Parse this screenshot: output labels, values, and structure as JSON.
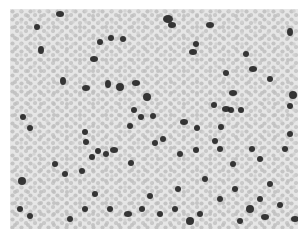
{
  "image": {
    "subject": "microscopy blood smear",
    "background_color": "#e4e4e4",
    "rbc_color": "#c2c2c2",
    "stained_cell_color": "#222222"
  },
  "stained_cells": [
    [
      50,
      5,
      4,
      3
    ],
    [
      101,
      29,
      3,
      3
    ],
    [
      84,
      50,
      4,
      3
    ],
    [
      90,
      33,
      3,
      3
    ],
    [
      113,
      30,
      3,
      3
    ],
    [
      31,
      41,
      3,
      4
    ],
    [
      27,
      18,
      3,
      3
    ],
    [
      53,
      72,
      3,
      4
    ],
    [
      76,
      79,
      4,
      3
    ],
    [
      98,
      75,
      3,
      4
    ],
    [
      110,
      78,
      4,
      4
    ],
    [
      126,
      74,
      4,
      3
    ],
    [
      137,
      88,
      4,
      4
    ],
    [
      158,
      10,
      5,
      4
    ],
    [
      162,
      16,
      4,
      3
    ],
    [
      200,
      16,
      4,
      3
    ],
    [
      186,
      35,
      3,
      3
    ],
    [
      183,
      43,
      4,
      3
    ],
    [
      236,
      45,
      3,
      3
    ],
    [
      243,
      60,
      4,
      3
    ],
    [
      280,
      23,
      3,
      4
    ],
    [
      216,
      64,
      3,
      3
    ],
    [
      223,
      84,
      4,
      3
    ],
    [
      260,
      70,
      3,
      3
    ],
    [
      216,
      100,
      4,
      3
    ],
    [
      204,
      96,
      3,
      3
    ],
    [
      231,
      101,
      3,
      3
    ],
    [
      283,
      86,
      4,
      4
    ],
    [
      280,
      97,
      3,
      3
    ],
    [
      13,
      108,
      3,
      3
    ],
    [
      20,
      119,
      3,
      3
    ],
    [
      75,
      123,
      3,
      3
    ],
    [
      76,
      133,
      3,
      3
    ],
    [
      120,
      117,
      3,
      3
    ],
    [
      131,
      108,
      3,
      3
    ],
    [
      124,
      101,
      3,
      3
    ],
    [
      174,
      113,
      4,
      3
    ],
    [
      187,
      119,
      3,
      3
    ],
    [
      211,
      118,
      3,
      3
    ],
    [
      221,
      101,
      3,
      3
    ],
    [
      153,
      130,
      3,
      3
    ],
    [
      143,
      107,
      3,
      3
    ],
    [
      104,
      141,
      4,
      3
    ],
    [
      96,
      145,
      3,
      3
    ],
    [
      82,
      148,
      3,
      3
    ],
    [
      88,
      142,
      3,
      3
    ],
    [
      121,
      154,
      3,
      3
    ],
    [
      145,
      134,
      3,
      3
    ],
    [
      170,
      145,
      3,
      3
    ],
    [
      186,
      141,
      3,
      3
    ],
    [
      210,
      140,
      3,
      3
    ],
    [
      205,
      132,
      3,
      3
    ],
    [
      223,
      155,
      3,
      3
    ],
    [
      242,
      140,
      3,
      3
    ],
    [
      250,
      150,
      3,
      3
    ],
    [
      275,
      140,
      3,
      3
    ],
    [
      280,
      125,
      3,
      3
    ],
    [
      12,
      172,
      4,
      4
    ],
    [
      45,
      155,
      3,
      3
    ],
    [
      72,
      162,
      3,
      3
    ],
    [
      55,
      165,
      3,
      3
    ],
    [
      85,
      185,
      3,
      3
    ],
    [
      100,
      200,
      3,
      3
    ],
    [
      118,
      205,
      4,
      3
    ],
    [
      132,
      200,
      3,
      3
    ],
    [
      140,
      187,
      3,
      3
    ],
    [
      150,
      205,
      3,
      3
    ],
    [
      165,
      200,
      3,
      3
    ],
    [
      180,
      212,
      4,
      4
    ],
    [
      190,
      205,
      3,
      3
    ],
    [
      210,
      190,
      3,
      3
    ],
    [
      225,
      180,
      3,
      3
    ],
    [
      240,
      200,
      4,
      4
    ],
    [
      255,
      208,
      4,
      3
    ],
    [
      270,
      196,
      3,
      3
    ],
    [
      285,
      210,
      4,
      3
    ],
    [
      20,
      207,
      3,
      3
    ],
    [
      10,
      200,
      3,
      3
    ],
    [
      60,
      210,
      3,
      3
    ],
    [
      75,
      200,
      3,
      3
    ],
    [
      250,
      190,
      3,
      3
    ],
    [
      260,
      175,
      3,
      3
    ],
    [
      195,
      170,
      3,
      3
    ],
    [
      168,
      180,
      3,
      3
    ],
    [
      230,
      212,
      3,
      3
    ]
  ]
}
